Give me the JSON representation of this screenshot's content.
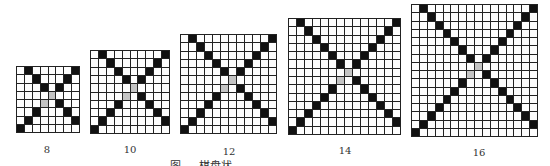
{
  "figure": {
    "grids": [
      {
        "n": 8,
        "label": "8",
        "x": 16,
        "y": 66,
        "w": 64,
        "h": 67
      },
      {
        "n": 10,
        "label": "10",
        "x": 90,
        "y": 50,
        "w": 80,
        "h": 84
      },
      {
        "n": 12,
        "label": "12",
        "x": 180,
        "y": 34,
        "w": 97,
        "h": 100
      },
      {
        "n": 14,
        "label": "14",
        "x": 288,
        "y": 18,
        "w": 113,
        "h": 117
      },
      {
        "n": 16,
        "label": "16",
        "x": 411,
        "y": 4,
        "w": 127,
        "h": 133
      }
    ],
    "labels": [
      {
        "text": "8",
        "x": 47,
        "y": 144
      },
      {
        "text": "10",
        "x": 130,
        "y": 144
      },
      {
        "text": "12",
        "x": 229,
        "y": 146
      },
      {
        "text": "14",
        "x": 345,
        "y": 145
      },
      {
        "text": "16",
        "x": 479,
        "y": 147
      }
    ],
    "pattern": {
      "black": "anti-diagonal (r, n-1-r) and shifted diagonal (r, r+1)",
      "gray": "center cells (n/2-1, n/2) and (n/2, n/2-1)"
    },
    "colors": {
      "black": "#111111",
      "gray": "#c4c4c4",
      "white": "#fdfdfd",
      "line": "#222222"
    },
    "caption": "图 …  棋盘状 …"
  }
}
